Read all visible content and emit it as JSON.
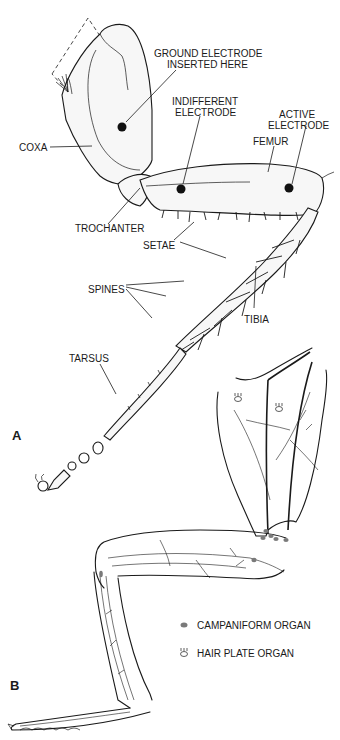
{
  "figure": {
    "panel_a": {
      "letter": "A",
      "labels": {
        "ground_electrode_line1": "GROUND ELECTRODE",
        "ground_electrode_line2": "INSERTED HERE",
        "indifferent_line1": "INDIFFERENT",
        "indifferent_line2": "ELECTRODE",
        "active_line1": "ACTIVE",
        "active_line2": "ELECTRODE",
        "femur": "FEMUR",
        "coxa": "COXA",
        "trochanter": "TROCHANTER",
        "setae": "SETAE",
        "spines": "SPINES",
        "tibia": "TIBIA",
        "tarsus": "TARSUS"
      }
    },
    "panel_b": {
      "letter": "B",
      "legend": [
        {
          "symbol": "campaniform-dot",
          "label": "CAMPANIFORM ORGAN",
          "color": "#7a7a7a"
        },
        {
          "symbol": "hair-plate-glyph",
          "label": "HAIR PLATE ORGAN"
        }
      ]
    }
  }
}
